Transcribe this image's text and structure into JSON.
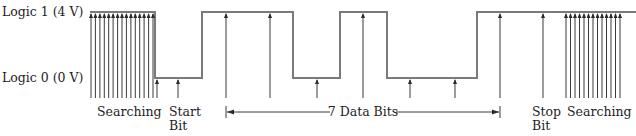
{
  "diagram": {
    "levels": {
      "high_label": "Logic 1 (4 V)",
      "low_label": "Logic 0 (0 V)",
      "high_y": 12,
      "low_y": 78,
      "arrow_base_y": 98
    },
    "waveform": {
      "color": "#7a7a7a",
      "segments": [
        {
          "x0": 90,
          "x1": 155,
          "level": "high"
        },
        {
          "x0": 155,
          "x1": 202,
          "level": "low"
        },
        {
          "x0": 202,
          "x1": 293,
          "level": "high"
        },
        {
          "x0": 293,
          "x1": 340,
          "level": "low"
        },
        {
          "x0": 340,
          "x1": 387,
          "level": "high"
        },
        {
          "x0": 387,
          "x1": 477,
          "level": "low"
        },
        {
          "x0": 477,
          "x1": 636,
          "level": "high"
        }
      ]
    },
    "sample_arrows": {
      "searching_left": {
        "x_start": 91,
        "x_end": 153,
        "count": 15,
        "level": "high"
      },
      "start_bit": [
        {
          "x": 157,
          "level": "low"
        },
        {
          "x": 178,
          "level": "low"
        }
      ],
      "data_bits": [
        {
          "x": 226,
          "level": "high"
        },
        {
          "x": 270,
          "level": "high"
        },
        {
          "x": 317,
          "level": "low"
        },
        {
          "x": 363,
          "level": "high"
        },
        {
          "x": 410,
          "level": "low"
        },
        {
          "x": 455,
          "level": "low"
        },
        {
          "x": 500,
          "level": "high"
        }
      ],
      "stop_bit": [
        {
          "x": 543,
          "level": "high"
        }
      ],
      "searching_right": {
        "x_start": 566,
        "x_end": 620,
        "count": 13,
        "level": "high"
      }
    },
    "labels": {
      "searching_left": "Searching",
      "start_bit_line1": "Start",
      "start_bit_line2": "Bit",
      "data_bits": "7 Data Bits",
      "stop_bit_line1": "Stop",
      "stop_bit_line2": "Bit",
      "searching_right": "Searching"
    },
    "dimension": {
      "x0": 226,
      "x1": 500,
      "y": 112
    }
  }
}
